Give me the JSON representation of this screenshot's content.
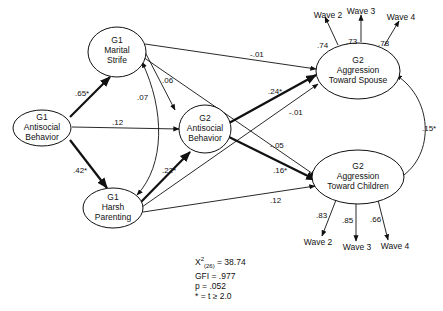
{
  "nodes": {
    "g1_antisocial": {
      "lines": [
        "G1",
        "Antisocial",
        "Behavior"
      ]
    },
    "g1_marital": {
      "lines": [
        "G1",
        "Marital",
        "Strife"
      ]
    },
    "g1_harsh": {
      "lines": [
        "G1",
        "Harsh",
        "Parenting"
      ]
    },
    "g2_antisocial": {
      "lines": [
        "G2",
        "Antisocial",
        "Behavior"
      ]
    },
    "g2_spouse": {
      "lines": [
        "G2",
        "Aggression",
        "Toward Spouse"
      ]
    },
    "g2_children": {
      "lines": [
        "G2",
        "Aggression",
        "Toward Children"
      ]
    }
  },
  "paths": {
    "antisocial_to_marital": ".65*",
    "antisocial_to_harsh": ".42*",
    "antisocial_to_g2antisocial": ".12",
    "marital_harsh_cov": ".07",
    "marital_to_g2antisocial": ".06",
    "harsh_to_g2antisocial": ".22*",
    "marital_to_spouse": "-.01",
    "marital_to_children": "-.05",
    "g2antisocial_to_spouse": ".24*",
    "g2antisocial_to_children": ".16*",
    "harsh_to_spouse": "-.01",
    "harsh_to_children": ".12",
    "spouse_children_cov": ".15*"
  },
  "indicators": {
    "spouse": [
      {
        "label": "Wave 2",
        "loading": ".74"
      },
      {
        "label": "Wave 3",
        "loading": ".73"
      },
      {
        "label": "Wave 4",
        "loading": ".78"
      }
    ],
    "children": [
      {
        "label": "Wave 2",
        "loading": ".83"
      },
      {
        "label": "Wave 3",
        "loading": ".85"
      },
      {
        "label": "Wave 4",
        "loading": ".66"
      }
    ]
  },
  "fit": {
    "chi_label": "X",
    "chi_sup": "2",
    "chi_sub": "(26)",
    "chi_value": " = 38.74",
    "gfi": "GFI = .977",
    "p": "p = .052",
    "note": "* = t ≥ 2.0"
  }
}
